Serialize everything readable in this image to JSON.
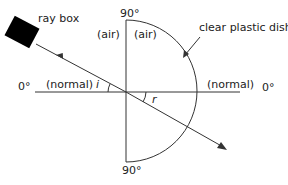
{
  "diagram": {
    "labels": {
      "ray_box": "ray box",
      "dish": "clear plastic dish",
      "air_left": "(air)",
      "air_right": "(air)",
      "normal_left": "(normal)",
      "normal_right": "(normal)",
      "angle_top": "90°",
      "angle_bottom": "90°",
      "angle_left": "0°",
      "angle_right": "0°",
      "incidence": "i",
      "refraction": "r"
    },
    "colors": {
      "line": "#222222",
      "ray_box": "#000000",
      "background": "#ffffff"
    }
  }
}
